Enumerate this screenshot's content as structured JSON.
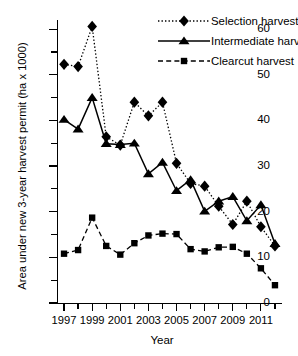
{
  "chart_data": {
    "type": "line",
    "title": "",
    "xlabel": "Year",
    "ylabel": "Area under new 3-year harvest permit (ha x 1000)",
    "x": [
      1997,
      1998,
      1999,
      2000,
      2001,
      2002,
      2003,
      2004,
      2005,
      2006,
      2007,
      2008,
      2009,
      2010,
      2011,
      2012
    ],
    "xlim": [
      1996.5,
      2012.5
    ],
    "ylim": [
      0,
      62
    ],
    "yticks": [
      0,
      10,
      20,
      30,
      40,
      50,
      60
    ],
    "yticks_minor": [
      5,
      15,
      25,
      35,
      45,
      55
    ],
    "xtick_labels": [
      "1997",
      "1999",
      "2001",
      "2003",
      "2005",
      "2007",
      "2009",
      "2011"
    ],
    "xtick_labelled_years": [
      1997,
      1999,
      2001,
      2003,
      2005,
      2007,
      2009,
      2011
    ],
    "grid": false,
    "legend_position": "top-right",
    "series": [
      {
        "name": "Selection harvest",
        "marker": "diamond",
        "line_style": "dotted",
        "color": "#000000",
        "values": [
          52.3,
          51.8,
          60.6,
          36.4,
          34.6,
          44.0,
          41.0,
          44.0,
          30.6,
          26.2,
          25.6,
          21.2,
          17.2,
          22.3,
          16.7,
          12.5
        ]
      },
      {
        "name": "Intermediate harvest",
        "marker": "triangle",
        "line_style": "solid",
        "color": "#000000",
        "values": [
          40.2,
          38.1,
          45.0,
          34.9,
          34.7,
          35.0,
          28.3,
          30.8,
          24.6,
          27.0,
          20.1,
          22.3,
          23.3,
          18.0,
          21.5,
          13.0
        ]
      },
      {
        "name": "Clearcut harvest",
        "marker": "square",
        "line_style": "dashed",
        "color": "#000000",
        "values": [
          10.8,
          11.6,
          18.7,
          12.5,
          10.6,
          13.1,
          14.8,
          15.2,
          15.1,
          11.8,
          11.3,
          12.2,
          12.3,
          10.8,
          7.6,
          3.9
        ]
      }
    ]
  },
  "legend": {
    "items": [
      {
        "label": "Selection harvest",
        "marker": "diamond",
        "line_style": "dotted"
      },
      {
        "label": "Intermediate harvest",
        "marker": "triangle",
        "line_style": "solid"
      },
      {
        "label": "Clearcut harvest",
        "marker": "square",
        "line_style": "dashed"
      }
    ]
  }
}
